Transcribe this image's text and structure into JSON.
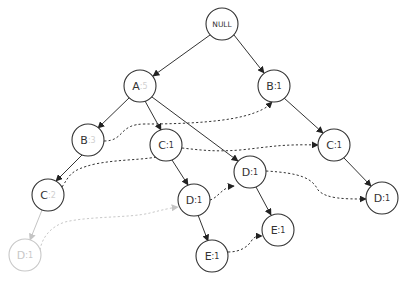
{
  "diagram": {
    "type": "fp-tree",
    "root": {
      "id": "null",
      "label": "NULL"
    },
    "nodes": [
      {
        "id": "null",
        "item": "NULL",
        "count": "",
        "x": 222,
        "y": 24,
        "faded": false
      },
      {
        "id": "a",
        "item": "A",
        "count": ":5",
        "count_dim": true,
        "x": 140,
        "y": 86,
        "faded": false
      },
      {
        "id": "b1",
        "item": "B",
        "count": ":1",
        "count_dim": false,
        "x": 274,
        "y": 86,
        "faded": false
      },
      {
        "id": "b_a",
        "item": "B",
        "count": ":3",
        "count_dim": true,
        "x": 88,
        "y": 140,
        "faded": false
      },
      {
        "id": "c_a",
        "item": "C",
        "count": ":1",
        "count_dim": false,
        "x": 166,
        "y": 145,
        "faded": false
      },
      {
        "id": "c_b1",
        "item": "C",
        "count": ":1",
        "count_dim": false,
        "x": 334,
        "y": 145,
        "faded": false
      },
      {
        "id": "c_ba",
        "item": "C",
        "count": ":2",
        "count_dim": true,
        "x": 48,
        "y": 195,
        "faded": false
      },
      {
        "id": "d_a",
        "item": "D",
        "count": ":1",
        "count_dim": false,
        "x": 250,
        "y": 172,
        "faded": false
      },
      {
        "id": "d_ca",
        "item": "D",
        "count": ":1",
        "count_dim": false,
        "x": 194,
        "y": 200,
        "faded": false
      },
      {
        "id": "d_cb1",
        "item": "D",
        "count": ":1",
        "count_dim": false,
        "x": 382,
        "y": 198,
        "faded": false
      },
      {
        "id": "e_da",
        "item": "E",
        "count": ":1",
        "count_dim": false,
        "x": 278,
        "y": 230,
        "faded": false
      },
      {
        "id": "e_dca",
        "item": "E",
        "count": ":1",
        "count_dim": false,
        "x": 212,
        "y": 256,
        "faded": false
      },
      {
        "id": "d_cba",
        "item": "D",
        "count": ":1",
        "count_dim": false,
        "x": 25,
        "y": 255,
        "faded": true
      }
    ],
    "labels": {
      "null": "NULL",
      "a_item": "A",
      "a_count": ":5",
      "b1_item": "B",
      "b1_count": ":1",
      "b_a_item": "B",
      "b_a_count": ":3",
      "c_a_item": "C",
      "c_a_count": ":1",
      "c_b1_item": "C",
      "c_b1_count": ":1",
      "c_ba_item": "C",
      "c_ba_count": ":2",
      "d_a_item": "D",
      "d_a_count": ":1",
      "d_ca_item": "D",
      "d_ca_count": ":1",
      "d_cb1_item": "D",
      "d_cb1_count": ":1",
      "e_da_item": "E",
      "e_da_count": ":1",
      "e_dca_item": "E",
      "e_dca_count": ":1",
      "d_cba_item": "D",
      "d_cba_count": ":1"
    },
    "tree_edges": [
      {
        "from": "null",
        "to": "a"
      },
      {
        "from": "null",
        "to": "b1"
      },
      {
        "from": "a",
        "to": "b_a"
      },
      {
        "from": "a",
        "to": "c_a"
      },
      {
        "from": "a",
        "to": "d_a"
      },
      {
        "from": "b1",
        "to": "c_b1"
      },
      {
        "from": "b_a",
        "to": "c_ba"
      },
      {
        "from": "c_a",
        "to": "d_ca"
      },
      {
        "from": "c_b1",
        "to": "d_cb1"
      },
      {
        "from": "d_a",
        "to": "e_da"
      },
      {
        "from": "d_ca",
        "to": "e_dca"
      },
      {
        "from": "c_ba",
        "to": "d_cba",
        "faded": true
      }
    ],
    "node_links": [
      {
        "item": "B",
        "from": "b_a",
        "to": "b1"
      },
      {
        "item": "C",
        "from": "c_ba",
        "to": "c_a"
      },
      {
        "item": "C",
        "from": "c_a",
        "to": "c_b1"
      },
      {
        "item": "D",
        "from": "d_ca",
        "to": "d_a"
      },
      {
        "item": "D",
        "from": "d_a",
        "to": "d_cb1"
      },
      {
        "item": "E",
        "from": "e_dca",
        "to": "e_da"
      },
      {
        "item": "D",
        "from": "d_cba",
        "to": "d_ca",
        "faded": true
      }
    ],
    "colors": {
      "stroke": "#333333",
      "faded": "#c8c8c8",
      "background": "#ffffff"
    }
  }
}
